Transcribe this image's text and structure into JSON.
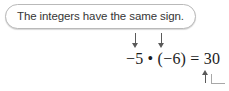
{
  "figure": {
    "callout": {
      "text": "The integers have the same sign."
    },
    "equation": {
      "text": "−5 • (−6) = 30",
      "left_factor": "−5",
      "operator": "•",
      "right_factor": "(−6)",
      "equals": "=",
      "product": "30"
    },
    "annotations": {
      "pointer_left_target": "−5",
      "pointer_right_target": "−6",
      "pointer_product_target": "30"
    },
    "colors": {
      "text": "#363636",
      "equation_text": "#1c1c1c",
      "bubble_border": "#b9b9b9",
      "bubble_fill": "#ffffff",
      "arrow": "#5a5a5a",
      "leader_line": "#a8a8a8",
      "background": "#ffffff"
    }
  }
}
